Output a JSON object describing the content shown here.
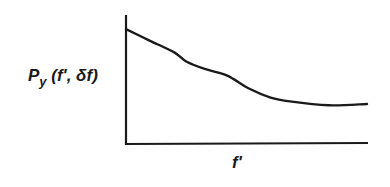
{
  "chart_data": {
    "type": "line",
    "title": "",
    "xlabel": "f'",
    "ylabel": {
      "main": "P",
      "subscript": "y",
      "args": " (f', δf)"
    },
    "xlim": [
      0,
      1
    ],
    "ylim": [
      0,
      1
    ],
    "grid": false,
    "ticks": false,
    "legend": null,
    "note": "Qualitative sketch; no tick labels. Values are normalized to axis extents.",
    "series": [
      {
        "name": "P_y(f', δf)",
        "x": [
          0.0,
          0.1,
          0.2,
          0.25,
          0.33,
          0.42,
          0.51,
          0.6,
          0.68,
          0.84,
          1.0
        ],
        "y": [
          0.89,
          0.8,
          0.71,
          0.64,
          0.58,
          0.53,
          0.43,
          0.36,
          0.33,
          0.3,
          0.31
        ]
      }
    ]
  }
}
